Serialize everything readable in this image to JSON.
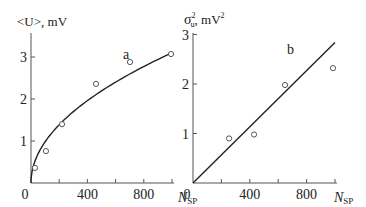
{
  "chart_data": [
    {
      "type": "scatter",
      "panel_label": "a",
      "ylabel": "<U>, mV",
      "xlabel": "N_SP",
      "xlim": [
        0,
        1000
      ],
      "ylim": [
        0,
        3.5
      ],
      "x_ticks": [
        0,
        200,
        400,
        600,
        800,
        1000
      ],
      "x_tick_labels": [
        "0",
        "400",
        "800"
      ],
      "x_tick_label_values": [
        0,
        400,
        800
      ],
      "y_ticks": [
        0,
        1,
        2,
        3
      ],
      "y_tick_labels": [
        "1",
        "2",
        "3"
      ],
      "y_tick_label_values": [
        1,
        2,
        3
      ],
      "grid": false,
      "series": [
        {
          "name": "measured",
          "marker": "open-circle",
          "x": [
            28,
            106,
            220,
            461,
            702,
            993
          ],
          "y": [
            0.36,
            0.76,
            1.4,
            2.36,
            2.88,
            3.07
          ]
        }
      ],
      "fit": {
        "model": "sqrt",
        "description": "U = 3.1 * sqrt(N/1000)",
        "coef": 3.1,
        "x_range": [
          0,
          1000
        ]
      }
    },
    {
      "type": "scatter",
      "panel_label": "b",
      "ylabel_main": "σ",
      "ylabel_sup": "2",
      "ylabel_sub": "u",
      "ylabel_unit": ", mV",
      "ylabel_unit_sup": "2",
      "xlabel": "N_SP",
      "xlim": [
        0,
        1000
      ],
      "ylim": [
        0,
        3
      ],
      "x_ticks": [
        0,
        200,
        400,
        600,
        800,
        1000
      ],
      "x_tick_labels": [
        "0",
        "400",
        "800"
      ],
      "x_tick_label_values": [
        0,
        400,
        800
      ],
      "y_ticks": [
        0,
        1,
        2,
        3
      ],
      "y_tick_labels": [
        "1",
        "2",
        "3"
      ],
      "y_tick_label_values": [
        1,
        2,
        3
      ],
      "grid": false,
      "series": [
        {
          "name": "measured",
          "marker": "open-circle",
          "x": [
            254,
            430,
            648,
            986
          ],
          "y": [
            0.9,
            0.98,
            1.98,
            2.32
          ]
        }
      ],
      "fit": {
        "model": "linear",
        "description": "σ² = 0.00284 * N",
        "slope": 0.00284,
        "x_range": [
          0,
          1000
        ]
      }
    }
  ],
  "labels": {
    "xlabel_main": "N",
    "xlabel_sub": "SP"
  }
}
